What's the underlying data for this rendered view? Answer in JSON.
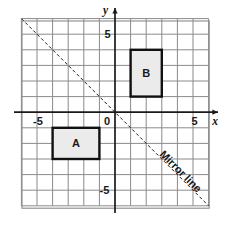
{
  "figure": {
    "kind": "coordinate-grid-reflection-diagram",
    "background_color": "#ffffff",
    "grid": {
      "line_color": "#8a8a8a",
      "minor_line_color": "#9a9a9a",
      "x_min": -6,
      "x_max": 6,
      "y_min": -6,
      "y_max": 6,
      "cell_size_units": 1,
      "show_grid": true
    },
    "axes": {
      "axis_color": "#1a1a1a",
      "x_axis_label": "x",
      "y_axis_label": "y",
      "origin_label": "0",
      "x_ticks": [
        {
          "value": -5,
          "label": "-5"
        },
        {
          "value": 5,
          "label": "5"
        }
      ],
      "y_ticks": [
        {
          "value": 5,
          "label": "5"
        },
        {
          "value": -5,
          "label": "-5"
        }
      ]
    },
    "shapes": [
      {
        "name": "A",
        "label": "A",
        "fill_color": "#ebebeb",
        "stroke_color": "#111111",
        "x_from": -4,
        "x_to": -1,
        "y_from": -3,
        "y_to": -1,
        "width_units": 3,
        "height_units": 2
      },
      {
        "name": "B",
        "label": "B",
        "fill_color": "#ebebeb",
        "stroke_color": "#111111",
        "x_from": 1,
        "x_to": 3,
        "y_from": 1,
        "y_to": 4,
        "width_units": 2,
        "height_units": 3
      }
    ],
    "mirror_line": {
      "label": "Mirror line",
      "equation": "y = -x",
      "style": "dashed",
      "color": "#1a1a1a",
      "from_point": [
        -6,
        6
      ],
      "to_point": [
        6,
        -6
      ]
    }
  }
}
